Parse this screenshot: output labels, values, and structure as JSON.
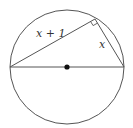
{
  "diagram": {
    "type": "circle-inscribed-right-triangle",
    "labels": {
      "hypotenuse_side": "x + 1",
      "short_side": "x"
    },
    "elements": [
      "circle",
      "diameter",
      "center-point",
      "chord-long",
      "chord-short",
      "right-angle-marker"
    ],
    "colors": {
      "stroke": "#555555",
      "center_dot": "#111111",
      "background": "#ffffff"
    }
  }
}
